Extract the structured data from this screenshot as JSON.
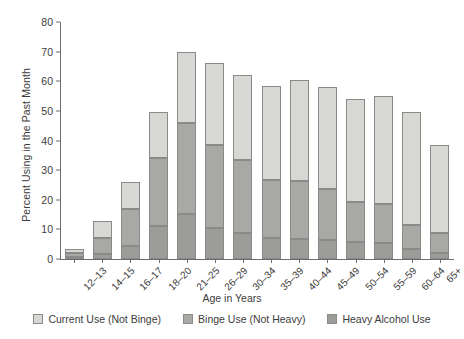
{
  "chart_data": {
    "type": "bar",
    "stacked": true,
    "title": "",
    "xlabel": "Age in Years",
    "ylabel": "Percent Using in the Past Month",
    "ylim": [
      0,
      80
    ],
    "yticks": [
      0,
      10,
      20,
      30,
      40,
      50,
      60,
      70,
      80
    ],
    "grid": false,
    "legend_position": "bottom",
    "categories": [
      "12–13",
      "14–15",
      "16–17",
      "18–20",
      "21–25",
      "26–29",
      "30–34",
      "35–39",
      "40–44",
      "45–49",
      "50–54",
      "55–59",
      "60–64",
      "65+"
    ],
    "series": [
      {
        "name": "Heavy Alcohol Use",
        "color": "#9c9c99",
        "values": [
          0.6,
          1.6,
          4.5,
          11.0,
          15.2,
          10.4,
          8.8,
          7.0,
          6.6,
          6.3,
          5.9,
          5.4,
          3.4,
          1.9
        ]
      },
      {
        "name": "Binge Use (Not Heavy)",
        "color": "#a8a8a5",
        "values": [
          1.5,
          5.4,
          12.3,
          23.2,
          30.8,
          28.2,
          24.7,
          19.8,
          19.7,
          17.4,
          13.5,
          13.2,
          8.2,
          7.0
        ]
      },
      {
        "name": "Current Use (Not Binge)",
        "color": "#d7d7d4",
        "values": [
          1.4,
          6.0,
          9.2,
          15.3,
          24.0,
          27.4,
          28.5,
          31.7,
          34.2,
          34.3,
          34.6,
          36.4,
          38.0,
          29.6
        ]
      }
    ],
    "totals": [
      3.5,
      13.0,
      26.0,
      49.5,
      70.0,
      66.0,
      62.0,
      58.5,
      60.5,
      58.0,
      54.0,
      55.0,
      49.6,
      38.5
    ]
  },
  "legend": {
    "items": [
      {
        "label": "Current Use (Not Binge)",
        "key": "current"
      },
      {
        "label": "Binge Use (Not Heavy)",
        "key": "binge"
      },
      {
        "label": "Heavy Alcohol Use",
        "key": "heavy"
      }
    ]
  }
}
